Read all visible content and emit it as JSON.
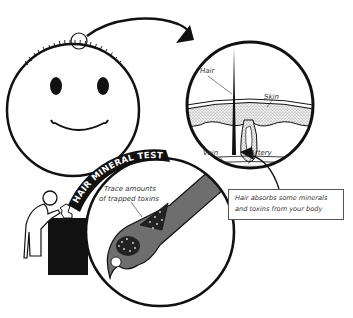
{
  "diagram": {
    "title": "Hair Mineral Test",
    "banner_label": "HAIR MINERAL TEST",
    "magnified_view": {
      "labels": {
        "hair": "Hair",
        "skin": "Skin",
        "vein": "Vein",
        "artery": "Artery"
      }
    },
    "callout": {
      "line1": "Hair absorbs some minerals",
      "line2": "and toxins from your body"
    },
    "hair_strand_view": {
      "label_line1": "Trace amounts",
      "label_line2": "of trapped toxins"
    },
    "colors": {
      "outline": "#111111",
      "hair_strand_fill": "#6e6e6e",
      "banner_bg": "#111111",
      "skin_texture": "#d8d8d8",
      "background": "#ffffff"
    }
  }
}
